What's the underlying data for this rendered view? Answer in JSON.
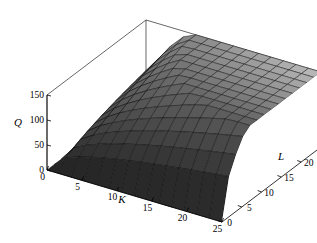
{
  "chart_data": {
    "type": "surface",
    "title": "",
    "xlabel": "K",
    "ylabel": "L",
    "zlabel": "Q",
    "xlim": [
      0,
      25
    ],
    "ylim": [
      0,
      25
    ],
    "zlim": [
      0,
      150
    ],
    "xticks": [
      0,
      5,
      10,
      15,
      20,
      25
    ],
    "yticks": [
      0,
      5,
      10,
      15,
      20,
      25
    ],
    "zticks": [
      0,
      50,
      100,
      150
    ],
    "xtick_labels": [
      "0",
      "5",
      "10",
      "15",
      "20",
      "25"
    ],
    "ytick_labels": [
      "0",
      "5",
      "10",
      "15",
      "20",
      "25"
    ],
    "ztick_labels": [
      "0",
      "50",
      "100",
      "150"
    ],
    "grid": true,
    "legend": null,
    "surface_color": "#4a4a4a",
    "mesh_color": "#0a0a0a",
    "box_color": "#000000",
    "background": "#ffffff",
    "mesh_steps": 14,
    "function": "Q = 12 * K^0.5 * L^0.5",
    "z_at_corners": {
      "K0_L0": 0,
      "K25_L0": 0,
      "K0_L25": 0,
      "K25_L25": 150
    },
    "view": {
      "azimuth_deg": 48,
      "elevation_deg": 22
    }
  },
  "axes": {
    "z": {
      "label": "Q",
      "ticks": [
        "150",
        "100",
        "50",
        "0"
      ]
    },
    "x": {
      "label": "K",
      "ticks": [
        "0",
        "5",
        "10",
        "15",
        "20",
        "25"
      ]
    },
    "y": {
      "label": "L",
      "ticks": [
        "0",
        "5",
        "10",
        "15",
        "20",
        "25"
      ]
    }
  }
}
